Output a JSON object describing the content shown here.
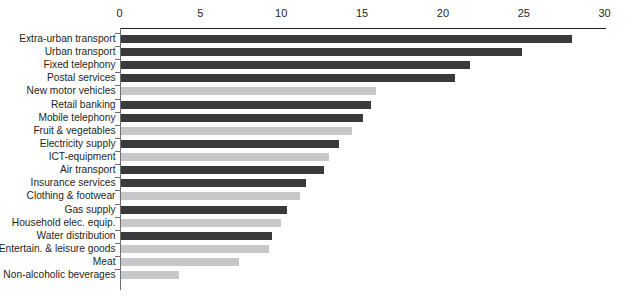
{
  "chart_data": {
    "type": "bar",
    "orientation": "horizontal",
    "title": "",
    "subtitle": "",
    "xlabel": "",
    "ylabel": "",
    "xlim": [
      0,
      30
    ],
    "xticks": [
      0,
      5,
      10,
      15,
      20,
      25,
      30
    ],
    "xtick_labels": [
      "0",
      "5",
      "10",
      "15",
      "20",
      "25",
      "30"
    ],
    "grid": false,
    "legend": null,
    "axis_position": "top",
    "colors": {
      "dark": "#3a3a3c",
      "light": "#c6c7c9",
      "axis": "#6d6e71",
      "text": "#231f20",
      "background": "#ffffff"
    },
    "categories": [
      "Extra-urban transport",
      "Urban transport",
      "Fixed telephony",
      "Postal services",
      "New motor vehicles",
      "Retail banking",
      "Mobile telephony",
      "Fruit & vegetables",
      "Electricity supply",
      "ICT-equipment",
      "Air transport",
      "Insurance services",
      "Clothing & footwear",
      "Gas supply",
      "Household elec. equip.",
      "Water distribution",
      "Entertain. & leisure goods",
      "Meat",
      "Non-alcoholic beverages"
    ],
    "values": [
      27.9,
      24.8,
      21.6,
      20.7,
      15.8,
      15.5,
      15.0,
      14.3,
      13.5,
      12.9,
      12.6,
      11.5,
      11.1,
      10.3,
      9.9,
      9.4,
      9.2,
      7.3,
      3.6
    ],
    "series": [
      {
        "name": "value",
        "values": [
          27.9,
          24.8,
          21.6,
          20.7,
          15.8,
          15.5,
          15.0,
          14.3,
          13.5,
          12.9,
          12.6,
          11.5,
          11.1,
          10.3,
          9.9,
          9.4,
          9.2,
          7.3,
          3.6
        ]
      }
    ],
    "bars": [
      {
        "label": "Extra-urban transport",
        "value": 27.9,
        "shade": "dark"
      },
      {
        "label": "Urban transport",
        "value": 24.8,
        "shade": "dark"
      },
      {
        "label": "Fixed telephony",
        "value": 21.6,
        "shade": "dark"
      },
      {
        "label": "Postal services",
        "value": 20.7,
        "shade": "dark"
      },
      {
        "label": "New motor vehicles",
        "value": 15.8,
        "shade": "light"
      },
      {
        "label": "Retail banking",
        "value": 15.5,
        "shade": "dark"
      },
      {
        "label": "Mobile telephony",
        "value": 15.0,
        "shade": "dark"
      },
      {
        "label": "Fruit & vegetables",
        "value": 14.3,
        "shade": "light"
      },
      {
        "label": "Electricity supply",
        "value": 13.5,
        "shade": "dark"
      },
      {
        "label": "ICT-equipment",
        "value": 12.9,
        "shade": "light"
      },
      {
        "label": "Air transport",
        "value": 12.6,
        "shade": "dark"
      },
      {
        "label": "Insurance services",
        "value": 11.5,
        "shade": "dark"
      },
      {
        "label": "Clothing & footwear",
        "value": 11.1,
        "shade": "light"
      },
      {
        "label": "Gas supply",
        "value": 10.3,
        "shade": "dark"
      },
      {
        "label": "Household elec. equip.",
        "value": 9.9,
        "shade": "light"
      },
      {
        "label": "Water distribution",
        "value": 9.4,
        "shade": "dark"
      },
      {
        "label": "Entertain. & leisure goods",
        "value": 9.2,
        "shade": "light"
      },
      {
        "label": "Meat",
        "value": 7.3,
        "shade": "light"
      },
      {
        "label": "Non-alcoholic beverages",
        "value": 3.6,
        "shade": "light"
      }
    ]
  }
}
